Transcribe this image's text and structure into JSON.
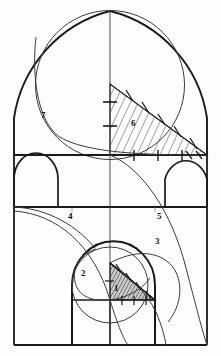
{
  "figure": {
    "background_color": "#fdfdfc",
    "ink_color": "#1a1a1a",
    "line_color_light": "#4a4a4a",
    "hatch_color": "#2a2a2a",
    "labels": [
      {
        "id": "label-1",
        "text": "1",
        "x": 114,
        "y": 288
      },
      {
        "id": "label-2",
        "text": "2",
        "x": 81,
        "y": 273
      },
      {
        "id": "label-3",
        "text": "3",
        "x": 155,
        "y": 241
      },
      {
        "id": "label-4",
        "text": "4",
        "x": 68,
        "y": 216
      },
      {
        "id": "label-5",
        "text": "5",
        "x": 157,
        "y": 216
      },
      {
        "id": "label-6",
        "text": "6",
        "x": 131,
        "y": 123
      },
      {
        "id": "label-7",
        "text": "7",
        "x": 41,
        "y": 115
      }
    ],
    "geometry": {
      "frame_left": 14,
      "frame_right": 207,
      "frame_bottom": 345,
      "center_axis_x": 110,
      "cornice_upper_y": 155,
      "cornice_lower_y": 207,
      "gable_apex_y": 11
    },
    "regions": [
      {
        "name": "upper-gable",
        "description": "pointed arch gable with inscribed circle"
      },
      {
        "name": "middle-band",
        "description": "band with two small arched openings"
      },
      {
        "name": "lower-band",
        "description": "base with central arched portal"
      }
    ],
    "hatched_areas": [
      {
        "name": "triangle-6",
        "label": "6",
        "style": "diagonal-hatch"
      },
      {
        "name": "triangle-1",
        "label": "1",
        "style": "dense-dark-hatch"
      }
    ]
  }
}
